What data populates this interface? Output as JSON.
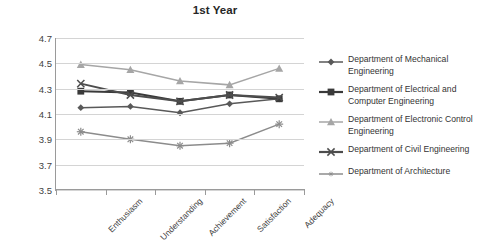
{
  "chart_data": {
    "type": "line",
    "title": "1st Year",
    "xlabel": "",
    "ylabel": "",
    "ylim": [
      3.5,
      4.7
    ],
    "ytick_step": 0.2,
    "yticks": [
      "4.7",
      "4.5",
      "4.3",
      "4.1",
      "3.9",
      "3.7",
      "3.5"
    ],
    "grid": true,
    "legend_position": "right",
    "categories": [
      "Enthusiasm",
      "Understanding",
      "Achievement",
      "Satisfaction",
      "Adequacy"
    ],
    "series": [
      {
        "name": "Department of Mechanical Engineering",
        "marker": "diamond",
        "color": "#595959",
        "values": [
          4.15,
          4.16,
          4.11,
          4.18,
          4.22
        ]
      },
      {
        "name": "Department of Electrical and Computer Engineering",
        "marker": "square",
        "color": "#3a3a3a",
        "values": [
          4.28,
          4.27,
          4.2,
          4.25,
          4.22
        ]
      },
      {
        "name": "Department of Electronic Control Engineering",
        "marker": "triangle",
        "color": "#a6a6a6",
        "values": [
          4.49,
          4.45,
          4.36,
          4.33,
          4.46
        ]
      },
      {
        "name": "Department of Civil Engineering",
        "marker": "x",
        "color": "#4d4d4d",
        "values": [
          4.34,
          4.25,
          4.2,
          4.25,
          4.23
        ]
      },
      {
        "name": "Department of Architecture",
        "marker": "asterisk",
        "color": "#8c8c8c",
        "values": [
          3.96,
          3.9,
          3.85,
          3.87,
          4.02
        ]
      }
    ]
  },
  "chart": {
    "title": "1st Year"
  },
  "legend": {
    "items": [
      {
        "label": "Department of Mechanical Engineering"
      },
      {
        "label": "Department of Electrical and Computer Engineering"
      },
      {
        "label": "Department of Electronic Control Engineering"
      },
      {
        "label": "Department of Civil Engineering"
      },
      {
        "label": "Department of Architecture"
      }
    ]
  }
}
